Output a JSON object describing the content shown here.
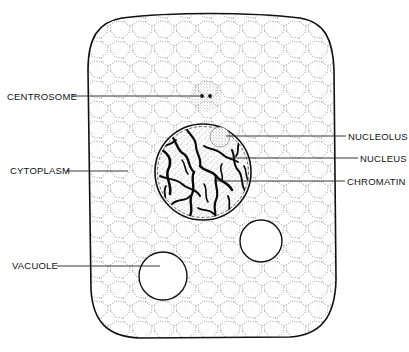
{
  "diagram": {
    "title": "",
    "colors": {
      "ink": "#111111",
      "stipple": "#555555",
      "background": "#ffffff",
      "chromatin": "#0a0a0a"
    },
    "labels": {
      "centrosome": "CENTROSOME",
      "cytoplasm": "CYTOPLASM",
      "vacuole": "VACUOLE",
      "nucleolus": "NUCLEOLUS",
      "nucleus": "NUCLEUS",
      "chromatin": "CHROMATIN"
    },
    "structures": {
      "cell_body": {
        "x": 88,
        "y": 15,
        "width": 247,
        "height": 323
      },
      "centrosome": {
        "cx": 206,
        "cy": 96,
        "r": 16,
        "granules": 2
      },
      "nucleus": {
        "cx": 203,
        "cy": 172,
        "r": 48
      },
      "nucleolus": {
        "cx": 220,
        "cy": 137,
        "r": 10
      },
      "vacuoles": [
        {
          "cx": 163,
          "cy": 276,
          "r": 24
        },
        {
          "cx": 261,
          "cy": 241,
          "r": 21
        }
      ]
    }
  }
}
